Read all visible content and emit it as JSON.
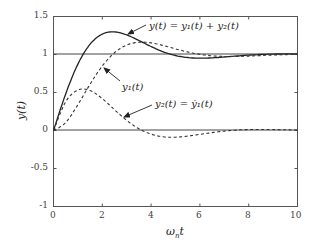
{
  "chart_data": {
    "type": "line",
    "title": "",
    "xlabel": "ωnt",
    "ylabel": "y(t)",
    "xlim": [
      0,
      10
    ],
    "ylim": [
      -1,
      1.5
    ],
    "grid": false,
    "legend": "none (inline annotations with arrows)",
    "x_ticks": [
      "0",
      "2",
      "4",
      "6",
      "8",
      "10"
    ],
    "y_ticks": [
      "1.5",
      "1",
      "0.5",
      "0",
      "-0.5",
      "-1"
    ],
    "reference_lines": [
      1,
      0
    ],
    "x": [
      0,
      0.5,
      1,
      1.5,
      2,
      2.5,
      3,
      3.5,
      4,
      4.5,
      5,
      5.5,
      6,
      6.5,
      7,
      7.5,
      8,
      9,
      10
    ],
    "series": [
      {
        "name": "y(t) = y1(t) + y2(t)",
        "style": "solid",
        "values": [
          0,
          0.4818,
          0.8737,
          1.1359,
          1.2687,
          1.2975,
          1.2576,
          1.1839,
          1.1048,
          1.0349,
          0.9866,
          0.9599,
          0.9514,
          0.9556,
          0.9667,
          0.9798,
          0.9917,
          1.0058,
          1.0079
        ]
      },
      {
        "name": "y1(t)",
        "style": "dashed",
        "values": [
          0,
          0.1044,
          0.3403,
          0.6105,
          0.8494,
          1.0234,
          1.1246,
          1.1617,
          1.1527,
          1.1184,
          1.0746,
          1.0336,
          1.0023,
          0.983,
          0.9743,
          0.9742,
          0.979,
          0.993,
          1.0027
        ]
      },
      {
        "name": "y2(t) = ẏ1(t)",
        "style": "dashed",
        "values": [
          0,
          0.3774,
          0.5334,
          0.5254,
          0.4193,
          0.2741,
          0.133,
          0.0222,
          -0.0479,
          -0.0835,
          -0.088,
          -0.0737,
          -0.0509,
          -0.0274,
          -0.0076,
          0.0056,
          0.0127,
          0.0128,
          0.0052
        ]
      }
    ],
    "annotations": [
      {
        "text": "y(t) = y1(t) + y2(t)",
        "arrow_to": [
          3.1,
          1.26
        ]
      },
      {
        "text": "y1(t)",
        "arrow_to": [
          2.1,
          0.86
        ]
      },
      {
        "text": "y2(t) = ẏ1(t)",
        "arrow_to": [
          2.9,
          0.17
        ]
      }
    ]
  },
  "labels": {
    "xlabel_main": "ω",
    "xlabel_sub": "n",
    "xlabel_tail": "t",
    "ylabel": "y(t)",
    "ann_y": "y(t) = y₁(t) + y₂(t)",
    "ann_y1": "y₁(t)",
    "ann_y2": "y₂(t) = ẏ₁(t)",
    "xt0": "0",
    "xt1": "2",
    "xt2": "4",
    "xt3": "6",
    "xt4": "8",
    "xt5": "10",
    "yt0": "1.5",
    "yt1": "1",
    "yt2": "0.5",
    "yt3": "0",
    "yt4": "-0.5",
    "yt5": "-1"
  }
}
